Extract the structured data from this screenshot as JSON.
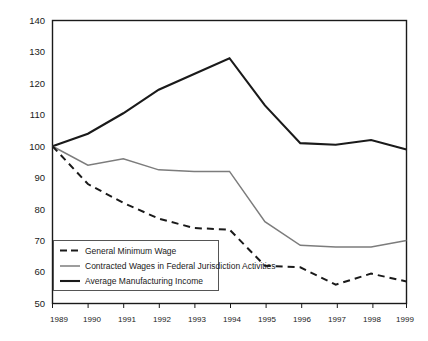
{
  "chart_data": {
    "type": "line",
    "title": "",
    "xlabel": "",
    "ylabel": "",
    "x": [
      1989,
      1990,
      1991,
      1992,
      1993,
      1994,
      1995,
      1996,
      1997,
      1998,
      1999
    ],
    "xtick_labels": [
      "1989",
      "1990",
      "1991",
      "1992",
      "1993",
      "1994",
      "1995",
      "1996",
      "1997",
      "1998",
      "1999"
    ],
    "ytick_labels": [
      "140",
      "130",
      "120",
      "110",
      "100",
      "90",
      "80",
      "70",
      "60",
      "50"
    ],
    "yticks": [
      140,
      130,
      120,
      110,
      100,
      90,
      80,
      70,
      60,
      50
    ],
    "xlim": [
      1989,
      1999
    ],
    "ylim": [
      50,
      140
    ],
    "grid": false,
    "legend_position": "bottom-left-inside",
    "series": [
      {
        "name": "General Minimum Wage",
        "style": "dashed",
        "color": "#1a1a1a",
        "values": [
          100,
          88,
          82,
          77,
          74,
          73.5,
          62,
          61.5,
          56,
          59.5,
          57
        ]
      },
      {
        "name": "Contracted Wages in Federal Jurisdiction Activities",
        "style": "solid-thin",
        "color": "#7c7c7c",
        "values": [
          100,
          94,
          96,
          92.5,
          92,
          92,
          76,
          68.5,
          68,
          68,
          70
        ]
      },
      {
        "name": "Average Manufacturing Income",
        "style": "solid-thick",
        "color": "#1a1a1a",
        "values": [
          100,
          104,
          110.5,
          118,
          123,
          128,
          113,
          101,
          100.5,
          102,
          99
        ]
      }
    ]
  },
  "legend": {
    "items": [
      {
        "label": "General Minimum Wage",
        "swatch": "dashed-line-swatch"
      },
      {
        "label": "Contracted Wages in Federal Jurisdiction Activities",
        "swatch": "gray-line-swatch"
      },
      {
        "label": "Average Manufacturing Income",
        "swatch": "black-line-swatch"
      }
    ]
  }
}
